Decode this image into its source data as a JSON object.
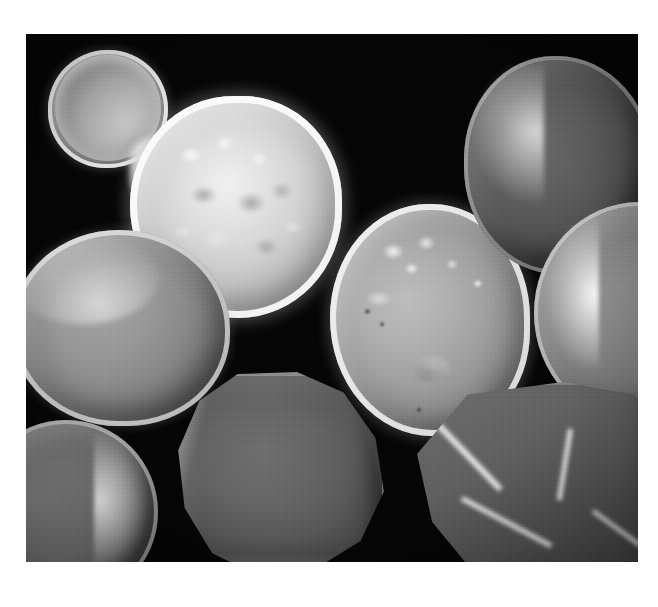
{
  "page": {
    "background_color": "#ffffff",
    "width": 658,
    "height": 607
  },
  "micrograph": {
    "kind": "sem-micrograph",
    "modality": "scanning electron microscopy",
    "color_mode": "grayscale",
    "background_color": "#050505",
    "frame": {
      "x": 26,
      "y": 34,
      "width": 612,
      "height": 528
    },
    "caption": "",
    "scale_bar": null,
    "annotations": [],
    "overlay_text": [],
    "colors": {
      "background": "#050505",
      "bright_rim": "#f8f8f8",
      "mid_gray": "#9e9e9e",
      "dark_gray": "#4a4a4a",
      "page_white": "#ffffff"
    },
    "particles": [
      {
        "id": "bud-sphere",
        "label": "small budding sphere",
        "shape": "sphere",
        "position": "top-left",
        "tone": "mid-bright",
        "surface": "smooth with bright rim"
      },
      {
        "id": "neck-bridge",
        "label": "sintered neck bridging bud to large sphere",
        "shape": "neck",
        "position": "upper-left",
        "tone": "bright",
        "surface": "fused"
      },
      {
        "id": "large-sphere",
        "label": "large bright sphere",
        "shape": "sphere",
        "position": "upper-center",
        "tone": "brightest",
        "surface": "mottled and pitted"
      },
      {
        "id": "left-sphere",
        "label": "left sphere",
        "shape": "sphere",
        "position": "mid-left",
        "tone": "mid-dark",
        "surface": "smooth, bright upper-left rim"
      },
      {
        "id": "center-right-sphere",
        "label": "cratered sphere",
        "shape": "sphere",
        "position": "center-right",
        "tone": "mid-bright",
        "surface": "craters, pits and bright speckles"
      },
      {
        "id": "upper-right-sphere",
        "label": "dark upper-right sphere",
        "shape": "sphere",
        "position": "upper-right",
        "tone": "dark",
        "surface": "smooth, bright left crescent"
      },
      {
        "id": "right-sphere",
        "label": "right edge sphere",
        "shape": "sphere",
        "position": "right, clipped by frame",
        "tone": "mid-dark",
        "surface": "smooth, bright left crescent"
      },
      {
        "id": "bottom-polyhedron",
        "label": "faceted polyhedral particle",
        "shape": "polyhedron",
        "position": "bottom-center",
        "tone": "dark",
        "surface": "faceted with faint edge highlights"
      },
      {
        "id": "bottom-left-sphere",
        "label": "partial sphere at bottom-left",
        "shape": "sphere",
        "position": "bottom-left, clipped by frame",
        "tone": "mid-dark",
        "surface": "smooth, bright right crescent"
      },
      {
        "id": "bottom-right-crystal",
        "label": "angular faceted crystal",
        "shape": "crystal",
        "position": "bottom-right",
        "tone": "mid-dark",
        "surface": "sharp facets with bright specular edges"
      }
    ]
  }
}
